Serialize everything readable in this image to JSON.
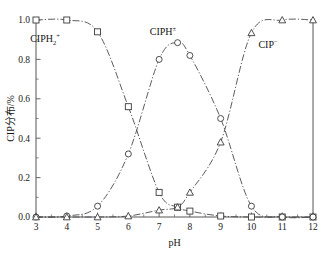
{
  "chart_data": {
    "type": "line",
    "title": "",
    "subtitle": "",
    "xlabel": "pH",
    "ylabel": "CIP分布/%",
    "xlim": [
      3,
      12
    ],
    "ylim": [
      0.0,
      1.0
    ],
    "grid": false,
    "legend_position": "inline-annotations",
    "x_ticks": [
      "3",
      "4",
      "5",
      "6",
      "7",
      "8",
      "9",
      "10",
      "11",
      "12"
    ],
    "x_tick_values": [
      3,
      4,
      5,
      6,
      7,
      8,
      9,
      10,
      11,
      12
    ],
    "y_ticks": [
      "0.0",
      "0.2",
      "0.4",
      "0.6",
      "0.8",
      "1.0"
    ],
    "y_tick_values": [
      0.0,
      0.2,
      0.4,
      0.6,
      0.8,
      1.0
    ],
    "x_minor_interval": 0.5,
    "y_minor_interval": 0.1,
    "series": [
      {
        "name": "CIPH2+",
        "label_base": "CIPH",
        "label_sub": "2",
        "label_sup": "+",
        "marker": "square",
        "x": [
          3,
          4,
          5,
          6,
          7,
          7.6,
          8,
          9,
          10,
          11,
          12
        ],
        "values": [
          1.0,
          1.0,
          0.94,
          0.56,
          0.125,
          0.05,
          0.03,
          0.005,
          0.0,
          0.0,
          0.0
        ]
      },
      {
        "name": "CIPH+-",
        "label_base": "CIPH",
        "label_sub": "",
        "label_sup": "±",
        "marker": "circle",
        "x": [
          3,
          4,
          5,
          6,
          7,
          7.6,
          8,
          9,
          10,
          11,
          12
        ],
        "values": [
          0.0,
          0.005,
          0.055,
          0.32,
          0.8,
          0.885,
          0.82,
          0.5,
          0.055,
          0.0,
          0.0
        ]
      },
      {
        "name": "CIP-",
        "label_base": "CIP",
        "label_sub": "",
        "label_sup": "−",
        "marker": "triangle",
        "x": [
          3,
          4,
          5,
          6,
          7,
          7.6,
          8,
          9,
          10,
          11,
          12
        ],
        "values": [
          0.0,
          0.0,
          0.0,
          0.005,
          0.035,
          0.05,
          0.125,
          0.38,
          0.935,
          1.0,
          1.0
        ]
      }
    ],
    "annotations": [
      {
        "name": "cationic-species-label",
        "base": "CIPH",
        "sub": "2",
        "sup": "+",
        "x_px": 45,
        "y_px": 42
      },
      {
        "name": "zwitterion-species-label",
        "base": "CIPH",
        "sub": "",
        "sup": "±",
        "x_px": 163,
        "y_px": 35
      },
      {
        "name": "anionic-species-label",
        "base": "CIP",
        "sub": "",
        "sup": "−",
        "x_px": 268,
        "y_px": 48
      }
    ],
    "colors": {
      "axis": "#555555",
      "line": "#4a4a4a",
      "marker_fill": "#ffffff",
      "marker_stroke": "#3a3a3a",
      "text": "#141414",
      "background": "#ffffff"
    }
  }
}
